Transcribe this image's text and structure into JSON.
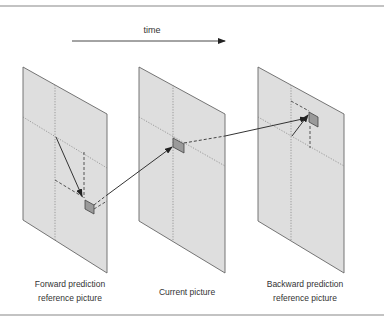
{
  "diagram": {
    "time_label": "time",
    "pictures": [
      {
        "id": "forward",
        "label_line1": "Forward prediction",
        "label_line2": "reference picture"
      },
      {
        "id": "current",
        "label_line1": "Current picture",
        "label_line2": ""
      },
      {
        "id": "backward",
        "label_line1": "Backward prediction",
        "label_line2": "reference picture"
      }
    ]
  },
  "colors": {
    "frame": "#888888",
    "panel_fill": "#dedede",
    "panel_edge": "#666666",
    "block_fill": "#9a9a9a",
    "line": "#333333",
    "text": "#333333"
  }
}
